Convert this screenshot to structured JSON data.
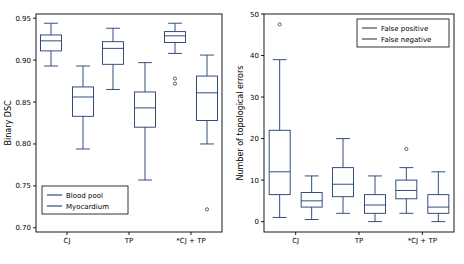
{
  "chart_data": [
    {
      "id": "left",
      "type": "box",
      "title": "",
      "xlabel": "",
      "ylabel": "Binary DSC",
      "ylim": [
        0.695,
        0.955
      ],
      "yticks": [
        0.7,
        0.75,
        0.8,
        0.85,
        0.9,
        0.95
      ],
      "ytick_labels": [
        "0.70",
        "0.75",
        "0.80",
        "0.85",
        "0.90",
        "0.95"
      ],
      "categories": [
        "CJ",
        "TP",
        "*CJ + TP"
      ],
      "grid": false,
      "legend_position": "lower-left",
      "legend": [
        {
          "name": "Blood pool",
          "color": "#1f3b73"
        },
        {
          "name": "Myocardium",
          "color": "#1f3b73"
        }
      ],
      "series": [
        {
          "name": "Blood pool",
          "color": "#1f3b73",
          "boxes": [
            {
              "category": "CJ",
              "q1": 0.911,
              "median": 0.923,
              "q3": 0.93,
              "whisker_low": 0.893,
              "whisker_high": 0.944,
              "fliers": []
            },
            {
              "category": "TP",
              "q1": 0.895,
              "median": 0.914,
              "q3": 0.922,
              "whisker_low": 0.865,
              "whisker_high": 0.938,
              "fliers": []
            },
            {
              "category": "*CJ + TP",
              "q1": 0.921,
              "median": 0.929,
              "q3": 0.934,
              "whisker_low": 0.908,
              "whisker_high": 0.944,
              "fliers": [
                0.878,
                0.872
              ]
            }
          ]
        },
        {
          "name": "Myocardium",
          "color": "#1f3b73",
          "boxes": [
            {
              "category": "CJ",
              "q1": 0.833,
              "median": 0.856,
              "q3": 0.868,
              "whisker_low": 0.794,
              "whisker_high": 0.893,
              "fliers": []
            },
            {
              "category": "TP",
              "q1": 0.82,
              "median": 0.843,
              "q3": 0.862,
              "whisker_low": 0.757,
              "whisker_high": 0.897,
              "fliers": []
            },
            {
              "category": "*CJ + TP",
              "q1": 0.828,
              "median": 0.861,
              "q3": 0.881,
              "whisker_low": 0.8,
              "whisker_high": 0.906,
              "fliers": [
                0.722
              ]
            }
          ]
        }
      ]
    },
    {
      "id": "right",
      "type": "box",
      "title": "",
      "xlabel": "",
      "ylabel": "Number of topological errors",
      "ylim": [
        -2.5,
        50
      ],
      "yticks": [
        0,
        10,
        20,
        30,
        40,
        50
      ],
      "ytick_labels": [
        "0",
        "10",
        "20",
        "30",
        "40",
        "50"
      ],
      "categories": [
        "CJ",
        "TP",
        "*CJ + TP"
      ],
      "grid": false,
      "legend_position": "upper-right",
      "legend": [
        {
          "name": "False positive",
          "color": "#1f3b73"
        },
        {
          "name": "False negative",
          "color": "#1f3b73"
        }
      ],
      "series": [
        {
          "name": "False positive",
          "color": "#1f3b73",
          "boxes": [
            {
              "category": "CJ",
              "q1": 6.5,
              "median": 12.0,
              "q3": 22.0,
              "whisker_low": 1.0,
              "whisker_high": 39.0,
              "fliers": [
                47.5
              ]
            },
            {
              "category": "TP",
              "q1": 6.0,
              "median": 9.0,
              "q3": 13.0,
              "whisker_low": 2.0,
              "whisker_high": 20.0,
              "fliers": []
            },
            {
              "category": "*CJ + TP",
              "q1": 5.5,
              "median": 7.5,
              "q3": 10.0,
              "whisker_low": 2.0,
              "whisker_high": 13.0,
              "fliers": [
                17.5
              ]
            }
          ]
        },
        {
          "name": "False negative",
          "color": "#1f3b73",
          "boxes": [
            {
              "category": "CJ",
              "q1": 3.5,
              "median": 5.0,
              "q3": 7.0,
              "whisker_low": 0.5,
              "whisker_high": 11.0,
              "fliers": []
            },
            {
              "category": "TP",
              "q1": 2.0,
              "median": 4.0,
              "q3": 6.5,
              "whisker_low": 0.0,
              "whisker_high": 11.0,
              "fliers": []
            },
            {
              "category": "*CJ + TP",
              "q1": 2.0,
              "median": 3.5,
              "q3": 6.5,
              "whisker_low": 0.0,
              "whisker_high": 12.0,
              "fliers": []
            }
          ]
        }
      ]
    }
  ]
}
